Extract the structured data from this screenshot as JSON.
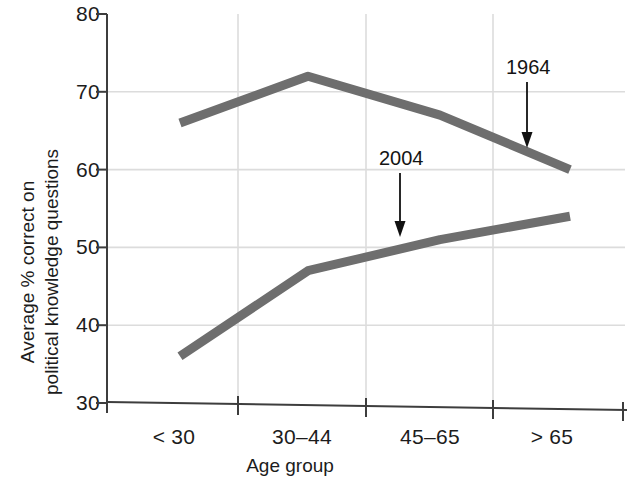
{
  "chart_data": {
    "type": "line",
    "title": "",
    "xlabel": "Age group",
    "ylabel": "Average % correct on political knowledge questions",
    "ylabel_line1": "Average % correct on",
    "ylabel_line2": "political knowledge questions",
    "categories": [
      "< 30",
      "30–44",
      "45–65",
      "> 65"
    ],
    "ylim": [
      30,
      80
    ],
    "yticks": [
      30,
      40,
      50,
      60,
      70,
      80
    ],
    "ytick_labels": [
      "30",
      "40",
      "50",
      "60",
      "70",
      "80"
    ],
    "grid": true,
    "legend": "none",
    "series": [
      {
        "name": "1964",
        "values": [
          66,
          72,
          67,
          60
        ],
        "color": "#6e6e6e"
      },
      {
        "name": "2004",
        "values": [
          36,
          47,
          51,
          54
        ],
        "color": "#6e6e6e"
      }
    ],
    "annotations": [
      {
        "text": "1964",
        "points_to_series": "1964",
        "x_value": 3.25,
        "y_value": 63.0
      },
      {
        "text": "2004",
        "points_to_series": "2004",
        "x_value": 2.55,
        "y_value": 50.5
      }
    ],
    "colors": {
      "line": "#6e6e6e",
      "axis": "#3d3d3d",
      "grid": "#d9d9d9",
      "text": "#1c1c1c",
      "background": "#ffffff"
    }
  }
}
